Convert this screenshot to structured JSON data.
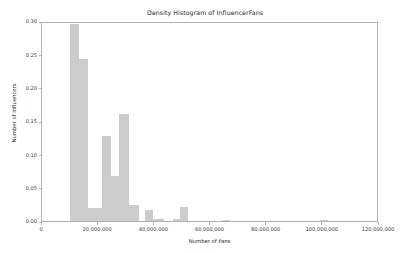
{
  "chart_data": {
    "type": "bar",
    "title": "Density Histogram of InfluencerFans",
    "xlabel": "Number of Fans",
    "ylabel": "Number of Influencers",
    "xlim": [
      0,
      120000000
    ],
    "ylim": [
      0.0,
      0.3
    ],
    "grid": false,
    "legend": null,
    "bar_color": "#cccccc",
    "bin_width": 5000000,
    "xticks": [
      0,
      20000000,
      40000000,
      60000000,
      80000000,
      100000000,
      120000000
    ],
    "xtick_labels": [
      "0",
      "20,000,000",
      "40,000,000",
      "60,000,000",
      "80,000,000",
      "100,000,000",
      "120,000,000"
    ],
    "yticks": [
      0.0,
      0.05,
      0.1,
      0.15,
      0.2,
      0.25,
      0.3
    ],
    "ytick_labels": [
      "0.00",
      "0.05",
      "0.10",
      "0.15",
      "0.20",
      "0.25",
      "0.30"
    ],
    "bins": [
      {
        "x0": 10000000,
        "x1": 13000000,
        "value": 0.295
      },
      {
        "x0": 13000000,
        "x1": 16500000,
        "value": 0.243
      },
      {
        "x0": 16500000,
        "x1": 21500000,
        "value": 0.02
      },
      {
        "x0": 21500000,
        "x1": 24500000,
        "value": 0.127
      },
      {
        "x0": 24500000,
        "x1": 27500000,
        "value": 0.068
      },
      {
        "x0": 27500000,
        "x1": 31000000,
        "value": 0.161
      },
      {
        "x0": 31000000,
        "x1": 34500000,
        "value": 0.024
      },
      {
        "x0": 36500000,
        "x1": 39500000,
        "value": 0.017
      },
      {
        "x0": 39500000,
        "x1": 43500000,
        "value": 0.003
      },
      {
        "x0": 46500000,
        "x1": 49000000,
        "value": 0.003
      },
      {
        "x0": 49000000,
        "x1": 52000000,
        "value": 0.021
      },
      {
        "x0": 64000000,
        "x1": 67000000,
        "value": 0.002
      },
      {
        "x0": 99000000,
        "x1": 102000000,
        "value": 0.002
      }
    ],
    "categories": [
      "10.0M-13.0M",
      "13.0M-16.5M",
      "16.5M-21.5M",
      "21.5M-24.5M",
      "24.5M-27.5M",
      "27.5M-31.0M",
      "31.0M-34.5M",
      "36.5M-39.5M",
      "39.5M-43.5M",
      "46.5M-49.0M",
      "49.0M-52.0M",
      "64.0M-67.0M",
      "99.0M-102.0M"
    ],
    "values": [
      0.295,
      0.243,
      0.02,
      0.127,
      0.068,
      0.161,
      0.024,
      0.017,
      0.003,
      0.003,
      0.021,
      0.002,
      0.002
    ]
  }
}
